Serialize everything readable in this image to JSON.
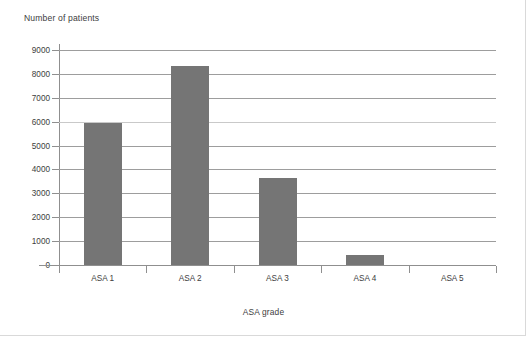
{
  "chart_data": {
    "type": "bar",
    "title": "",
    "ylabel": "Number of patients",
    "xlabel": "ASA grade",
    "categories": [
      "ASA 1",
      "ASA 2",
      "ASA 3",
      "ASA 4",
      "ASA 5"
    ],
    "values": [
      5950,
      8350,
      3650,
      420,
      0
    ],
    "ylim": [
      0,
      9000
    ],
    "yticks": [
      0,
      1000,
      2000,
      3000,
      4000,
      5000,
      6000,
      7000,
      8000,
      9000
    ],
    "ytick_labels": [
      "0",
      "1000",
      "2000",
      "3000",
      "4000",
      "5000",
      "6000",
      "7000",
      "8000",
      "9000"
    ],
    "grid": true,
    "legend": null,
    "bar_color": "#757575",
    "axis_color": "#8f8f8f",
    "grid_color": "#9d9d9d",
    "text_color": "#3d3d3d",
    "background": "#ffffff"
  }
}
